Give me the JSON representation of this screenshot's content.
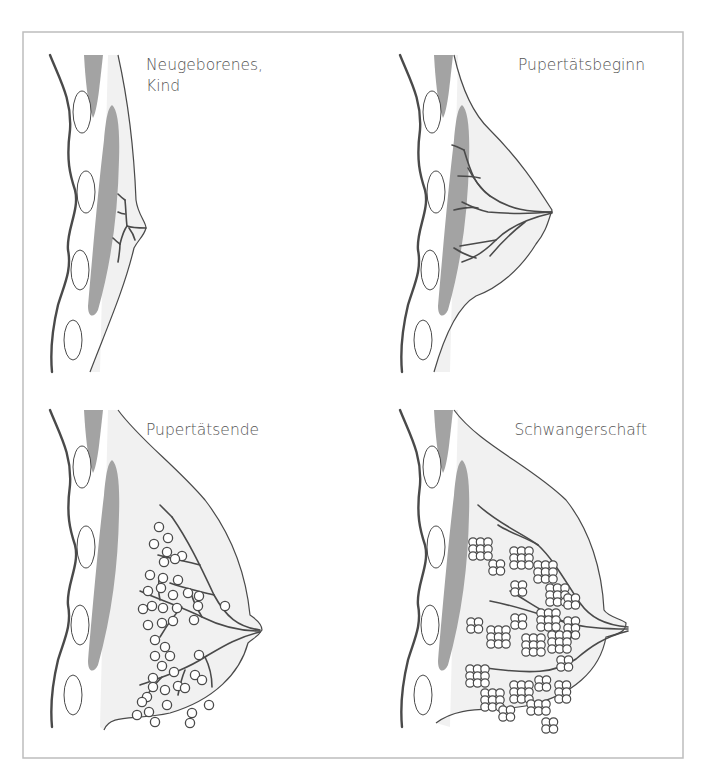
{
  "figure": {
    "frame": {
      "x": 23,
      "y": 32,
      "width": 660,
      "height": 726,
      "stroke": "#bdbdbd"
    },
    "colors": {
      "ink": "#4a4a4a",
      "muscle": "#a3a3a3",
      "breast_fill": "#f1f1f1",
      "chest_fill": "#fbfbfb",
      "lobule_fill": "#ffffff",
      "label": "#555555"
    },
    "panels": [
      {
        "id": "newborn",
        "label_lines": [
          "Neugeborenes,",
          "Kind"
        ],
        "label_x": 146,
        "label_y": 70,
        "label_anchor": "start",
        "ox": 0,
        "oy": 0,
        "stage": "newborn"
      },
      {
        "id": "puberty-start",
        "label_lines": [
          "Pupertätsbeginn"
        ],
        "label_x": 645,
        "label_y": 70,
        "label_anchor": "end",
        "ox": 350,
        "oy": 0,
        "stage": "puberty_start"
      },
      {
        "id": "puberty-end",
        "label_lines": [
          "Pupertätsende"
        ],
        "label_x": 146,
        "label_y": 435,
        "label_anchor": "start",
        "ox": 0,
        "oy": 355,
        "stage": "puberty_end"
      },
      {
        "id": "pregnancy",
        "label_lines": [
          "Schwangerschaft"
        ],
        "label_x": 647,
        "label_y": 435,
        "label_anchor": "end",
        "ox": 350,
        "oy": 355,
        "stage": "pregnancy"
      }
    ]
  }
}
